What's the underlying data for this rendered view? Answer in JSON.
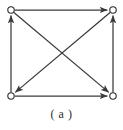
{
  "figure": {
    "caption": "( a )",
    "label": "a",
    "kind": "directed-graph-diagram",
    "background_color": "#ffffff",
    "line_color": "#3a3a3a",
    "node_fill_color": "#ffffff",
    "node_stroke_color": "#2b2b2b"
  },
  "graph": {
    "node_radius": 3.2,
    "nodes": [
      {
        "id": "tl",
        "name": "top-left",
        "x": 11,
        "y": 10
      },
      {
        "id": "tr",
        "name": "top-right",
        "x": 113,
        "y": 10
      },
      {
        "id": "bl",
        "name": "bottom-left",
        "x": 11,
        "y": 96
      },
      {
        "id": "br",
        "name": "bottom-right",
        "x": 113,
        "y": 96
      }
    ],
    "edges": [
      {
        "id": "e1",
        "name": "top-edge",
        "from": "tl",
        "to": "tr",
        "arrow": "end"
      },
      {
        "id": "e2",
        "name": "bottom-edge",
        "from": "bl",
        "to": "br",
        "arrow": "end"
      },
      {
        "id": "e3",
        "name": "left-edge",
        "from": "bl",
        "to": "tl",
        "arrow": "end"
      },
      {
        "id": "e4",
        "name": "right-edge",
        "from": "br",
        "to": "tr",
        "arrow": "end"
      },
      {
        "id": "e5",
        "name": "diagonal-tl-br",
        "from": "tl",
        "to": "br",
        "arrow": "end"
      },
      {
        "id": "e6",
        "name": "diagonal-tr-bl",
        "from": "tr",
        "to": "bl",
        "arrow": "end"
      }
    ]
  }
}
